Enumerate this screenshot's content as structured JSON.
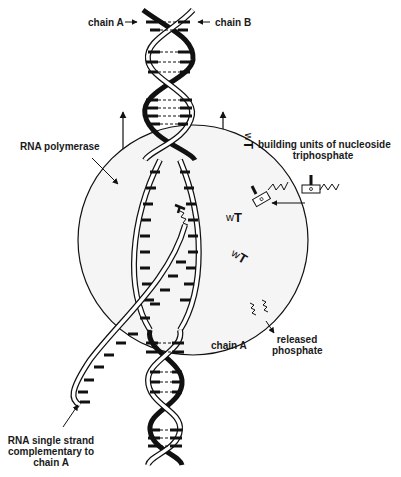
{
  "figure": {
    "colors": {
      "ink": "#111111",
      "strand_fill": "#ffffff",
      "sphere_fill": "#f4f4f4",
      "background": "#ffffff"
    }
  },
  "labels": {
    "chain_a_top": "chain A",
    "chain_b_top": "chain B",
    "rna_polymerase": "RNA polymerase",
    "building_units_line1": "building units of nucleoside",
    "building_units_line2": "triphosphate",
    "chain_a_bottom": "chain A",
    "released_line1": "released",
    "released_line2": "phosphate",
    "rna_strand_line1": "RNA single strand",
    "rna_strand_line2": "complementary to",
    "rna_strand_line3": "chain A"
  },
  "elements": {
    "dna_double_helix": "dna-helix",
    "rna_polymerase_sphere": "enzyme-sphere",
    "nucleotide_units": 4,
    "released_phosphates": 2,
    "movement_arrows": 2
  }
}
